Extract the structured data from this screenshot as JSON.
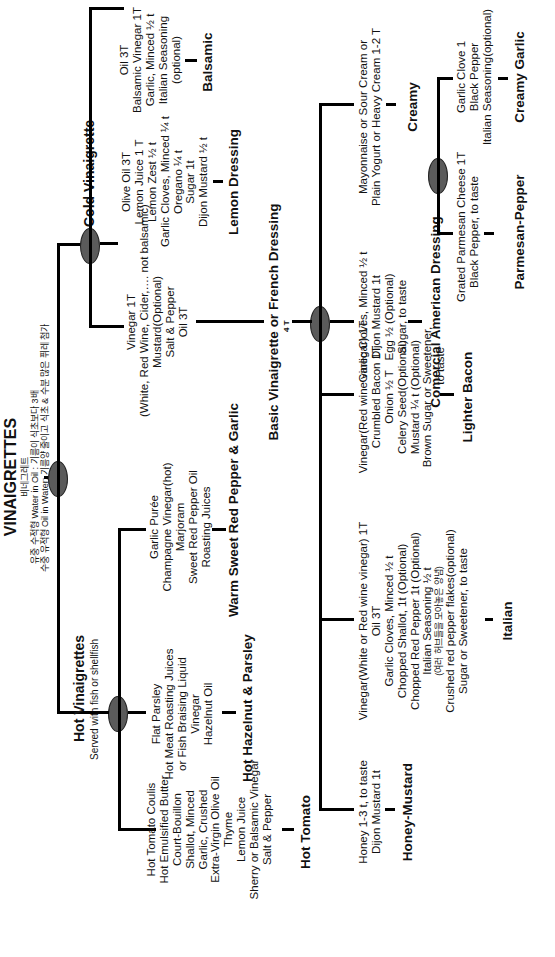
{
  "diagram": {
    "title": "VINAIGRETTES",
    "title_korean": "비네그레트",
    "note_line1": "유중 수적형 Water in Oil : 기름이 식초보다 3배",
    "note_line2": "수중 유적형 Oil in Water: 기름양 줄이고 식초 & 수분 많은 퓌레 첨가",
    "colors": {
      "line": "#000000",
      "node_fill": "#5b5b5b",
      "background": "#ffffff"
    },
    "branches": {
      "cold": {
        "label": "Cold  Vinaigrette",
        "children": {
          "basic": {
            "ingredients": [
              "Vinegar  1T",
              "(White, Red Wine, Cider,…. not balsamic)",
              "Mustard(Optional)",
              "Salt & Pepper",
              "Oil 3T"
            ],
            "name": "Basic Vinaigrette or French Dressing",
            "amount": "4 T",
            "children": {
              "italian": {
                "ingredients": [
                  "Vinegar(White or Red wine vinegar) 1T",
                  "Oil 3T",
                  "Garlic Cloves, Minced  ½ t",
                  "Chopped  Shallot, 1t (Optional)",
                  "Chopped  Red  Pepper   1t  (Optional)",
                  "Italian Seasoning  ½ t",
                  "(여러 허브들을 모아놓은 양념)",
                  "Crushed  red pepper flakes(optional)",
                  "Sugar or Sweetener, to taste"
                ],
                "name": "Italian"
              },
              "lighter_bacon": {
                "ingredients": [
                  "Vinegar(Red wine vinegar) 1T",
                  "Crumbled  Bacon 1T",
                  "Onion   ½ T",
                  "Celery Seed(Optional)",
                  "Mustard  ¼ t (Optional)",
                  "Brown Sugar or Sweetener,",
                  "to taste"
                ],
                "name": "Lighter Bacon"
              },
              "american": {
                "ingredients": [
                  "Garlic Cloves, Minced  ½  t",
                  "Dijon Mustard 1t",
                  "Egg ½ (Optional)",
                  "Sugar, to taste"
                ],
                "name": "Comercial American Dressing"
              },
              "creamy": {
                "ingredients": [
                  "Mayonnaise  or  Sour Cream or",
                  "Plain Yogurt or Heavy Cream 1-2 T"
                ],
                "label": "Creamy",
                "children": {
                  "parmesan": {
                    "ingredients": [
                      "Grated Parmesan Cheese  1T",
                      "Black Pepper, to taste"
                    ],
                    "name": "Parmesan-Pepper"
                  },
                  "garlic": {
                    "ingredients": [
                      "Garlic Clove  1",
                      "Black Pepper",
                      "Italian Seasoning(optional)"
                    ],
                    "name": "Creamy Garlic"
                  }
                }
              },
              "honey": {
                "ingredients": [
                  "Honey  1-3 t, to taste",
                  "Dijon  Mustard 1t"
                ],
                "name": "Honey-Mustard"
              }
            }
          },
          "lemon": {
            "ingredients": [
              "Olive Oil 3T",
              "Lemon Juice 1 T",
              "Lemon Zest  ½ t",
              "Garlic Cloves, Minced  ¼ t",
              "Oregano ¼  t",
              "Sugar  1t",
              "Dijon Mustard ½ t"
            ],
            "name": "Lemon Dressing"
          },
          "balsamic": {
            "ingredients": [
              "Oil  3T",
              "Balsamic Vinegar  1T",
              "Garlic, Minced  ½ t",
              "Italian Seasoning",
              "(optional)"
            ],
            "name": "Balsamic"
          }
        }
      },
      "hot": {
        "label": "Hot Vinaigrettes",
        "sublabel": "Served with fish or shellfish",
        "children": {
          "tomato": {
            "ingredients": [
              "Hot Tomato Coulis",
              "Hot Emulsified Butter",
              "Court-Bouillon",
              "Shallot, Minced",
              "Garlic, Crushed",
              "Extra-Virgin Olive Oil",
              "Thyme",
              "Lemon Juice",
              "Sherry or Balsamic Vinegar",
              "Salt & Pepper"
            ],
            "name": "Hot Tomato"
          },
          "hazelnut": {
            "ingredients": [
              "Flat Parsley",
              "Hot Meat Roasting Juices",
              "or Fish Braising Liquid",
              "Vinegar",
              "Hazelnut Oil"
            ],
            "name": "Hot Hazelnut & Parsley"
          },
          "redpepper": {
            "ingredients": [
              "Garlic Purée",
              "Champagne Vinegar(hot)",
              "Marjoram",
              "Sweet Red Pepper Oil",
              "Roasting Juices"
            ],
            "name": "Warm Sweet Red Pepper & Garlic"
          }
        }
      }
    }
  }
}
